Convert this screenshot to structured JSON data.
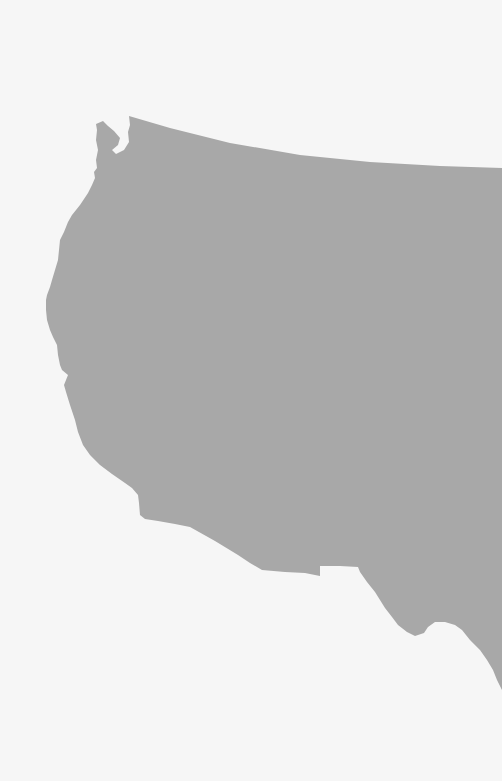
{
  "map": {
    "title": "Western United States silhouette",
    "region": "Western United States",
    "background_color": "#f6f6f6",
    "land_color": "#a8a8a8",
    "shapes": [
      {
        "name": "western-us-landmass",
        "fill": "#a8a8a8",
        "path": "M96,124 L103,121 L108,126 L114,131 L120,138 L118,145 L112,150 L116,154 L124,150 L129,142 L128,132 L130,125 L129,116 L170,128 L230,143 L300,155 L370,162 L440,166 L502,168 L502,690 L497,680 L493,670 L487,660 L480,650 L470,640 L462,630 L455,625 L445,622 L435,622 L428,627 L424,633 L415,636 L407,632 L398,625 L392,617 L385,608 L380,600 L375,592 L367,582 L360,572 L358,567 L340,566 L320,566 L320,576 L305,573 L285,572 L262,570 L250,563 L238,555 L215,541 L190,527 L175,524 L158,521 L145,519 L140,515 L139,503 L138,495 L132,488 L125,483 L112,474 L100,465 L90,455 L83,445 L78,432 L75,420 L70,405 L66,392 L64,385 L68,375 L62,370 L60,365 L58,355 L57,345 L53,337 L50,330 L47,320 L46,310 L46,300 L47,295 L50,287 L52,280 L55,270 L58,260 L59,250 L60,240 L64,232 L68,222 L72,215 L80,205 L88,193 L92,185 L95,178 L94,172 L97,168 L96,160 L98,150 L96,140 L97,130 Z"
      }
    ]
  }
}
